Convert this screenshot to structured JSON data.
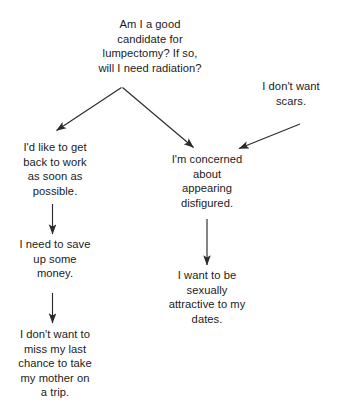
{
  "diagram": {
    "type": "decision-branch-flow",
    "title_node": {
      "id": "root-question",
      "text": "Am I a good\ncandidate for\nlumpectomy? If so,\nwill I need radiation?"
    },
    "nodes": [
      {
        "id": "return-to-work",
        "text": "I'd like to get\nback to work\nas soon as\npossible."
      },
      {
        "id": "save-money",
        "text": "I need to save\nup some\nmoney."
      },
      {
        "id": "mother-trip",
        "text": "I don't want to\nmiss my last\nchance to take\nmy mother on\na trip."
      },
      {
        "id": "appearing-disfigured",
        "text": "I'm concerned\nabout\nappearing\ndisfigured."
      },
      {
        "id": "sexually-attractive",
        "text": "I want to be\nsexually\nattractive to my\ndates."
      },
      {
        "id": "no-scars",
        "text": "I don't want\nscars."
      }
    ],
    "edges": [
      {
        "id": "root-to-work",
        "from": "root-question",
        "to": "return-to-work"
      },
      {
        "id": "root-to-disfigured",
        "from": "root-question",
        "to": "appearing-disfigured"
      },
      {
        "id": "scars-to-disfigured",
        "from": "no-scars",
        "to": "appearing-disfigured"
      },
      {
        "id": "work-to-money",
        "from": "return-to-work",
        "to": "save-money"
      },
      {
        "id": "money-to-trip",
        "from": "save-money",
        "to": "mother-trip"
      },
      {
        "id": "disfigured-to-attractive",
        "from": "appearing-disfigured",
        "to": "sexually-attractive"
      }
    ],
    "colors": {
      "background": "#ffffff",
      "text": "#1b1b1b",
      "line": "#2b2b2b"
    }
  }
}
